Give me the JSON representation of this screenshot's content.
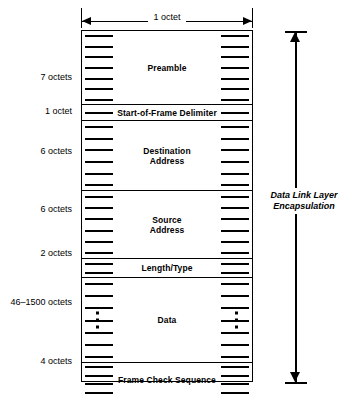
{
  "diagram": {
    "title_top_dimension": "1 octet",
    "right_bracket_label": "Data Link Layer\nEncapsulation",
    "colors": {
      "line": "#000000",
      "background": "#ffffff",
      "text": "#000000"
    },
    "fields": [
      {
        "name": "preamble",
        "label": "Preamble",
        "size_label": "7 octets",
        "octets": 7,
        "ticks": 7,
        "has_ellipsis": false
      },
      {
        "name": "start-of-frame-delimiter",
        "label": "Start-of-Frame Delimiter",
        "size_label": "1 octet",
        "octets": 1,
        "ticks": 1,
        "has_ellipsis": false
      },
      {
        "name": "destination-address",
        "label": "Destination\nAddress",
        "size_label": "6 octets",
        "octets": 6,
        "ticks": 6,
        "has_ellipsis": false
      },
      {
        "name": "source-address",
        "label": "Source\nAddress",
        "size_label": "6 octets",
        "octets": 6,
        "ticks": 6,
        "has_ellipsis": false
      },
      {
        "name": "length-type",
        "label": "Length/Type",
        "size_label": "2 octets",
        "octets": 2,
        "ticks": 2,
        "has_ellipsis": false
      },
      {
        "name": "data",
        "label": "Data",
        "size_label": "46–1500 octets",
        "octets": null,
        "ticks": 7,
        "has_ellipsis": true
      },
      {
        "name": "frame-check-sequence",
        "label": "Frame Check Sequence",
        "size_label": "4 octets",
        "octets": 4,
        "ticks": 4,
        "has_ellipsis": false
      }
    ]
  },
  "chart_data": {
    "type": "table",
    "categories": [
      "Preamble",
      "Start-of-Frame Delimiter",
      "Destination Address",
      "Source Address",
      "Length/Type",
      "Data",
      "Frame Check Sequence"
    ],
    "values": [
      7,
      1,
      6,
      6,
      2,
      773,
      4
    ],
    "value_labels": [
      "7 octets",
      "1 octet",
      "6 octets",
      "6 octets",
      "2 octets",
      "46–1500 octets",
      "4 octets"
    ],
    "xlabel": "1 octet",
    "ylabel": "",
    "annotations": [
      "Data Link Layer Encapsulation"
    ]
  }
}
